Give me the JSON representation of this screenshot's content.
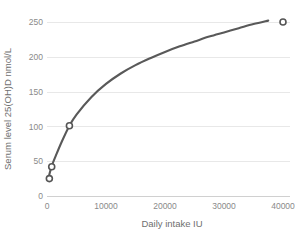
{
  "chart_data": {
    "type": "line",
    "title": "",
    "xlabel": "Daily intake IU",
    "ylabel": "Serum level 25(OH)D nmol/L",
    "xlim": [
      0,
      42000
    ],
    "ylim": [
      0,
      265
    ],
    "xticks": [
      0,
      10000,
      20000,
      30000,
      40000
    ],
    "xtick_labels": [
      "0",
      "10000",
      "20000",
      "30000",
      "40000"
    ],
    "yticks": [
      0,
      50,
      100,
      150,
      200,
      250
    ],
    "ytick_labels": [
      "0",
      "50",
      "100",
      "150",
      "200",
      "250"
    ],
    "grid": "horizontal",
    "legend": "none",
    "series": [
      {
        "name": "Fitted dose-response curve",
        "type": "line",
        "color": "#595959",
        "points": [
          {
            "x": 200,
            "y": 24
          },
          {
            "x": 400,
            "y": 31
          },
          {
            "x": 800,
            "y": 43
          },
          {
            "x": 1500,
            "y": 58
          },
          {
            "x": 2500,
            "y": 78
          },
          {
            "x": 3800,
            "y": 101
          },
          {
            "x": 5000,
            "y": 117
          },
          {
            "x": 7500,
            "y": 142
          },
          {
            "x": 10000,
            "y": 161
          },
          {
            "x": 12500,
            "y": 176
          },
          {
            "x": 15000,
            "y": 188
          },
          {
            "x": 17500,
            "y": 198
          },
          {
            "x": 20000,
            "y": 207
          },
          {
            "x": 22500,
            "y": 215
          },
          {
            "x": 25000,
            "y": 222
          },
          {
            "x": 27500,
            "y": 229
          },
          {
            "x": 30000,
            "y": 235
          },
          {
            "x": 32500,
            "y": 241
          },
          {
            "x": 35000,
            "y": 247
          },
          {
            "x": 37500,
            "y": 252
          }
        ]
      },
      {
        "name": "Observed data points",
        "type": "scatter",
        "color": "#555555",
        "marker": "open-circle",
        "points": [
          {
            "x": 400,
            "y": 25
          },
          {
            "x": 800,
            "y": 42
          },
          {
            "x": 3800,
            "y": 101
          },
          {
            "x": 40000,
            "y": 250
          }
        ]
      }
    ]
  },
  "colors": {
    "curve": "#595959",
    "marker_stroke": "#555555",
    "marker_fill": "#ffffff",
    "gridline": "#e8e8e8",
    "axis": "#d0d0d0",
    "tick_text": "#8a8a8a",
    "axis_title": "#6f6f6f",
    "background": "#ffffff"
  }
}
